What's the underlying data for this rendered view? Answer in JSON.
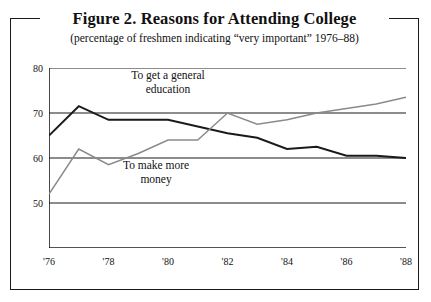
{
  "figure": {
    "title": "Figure 2.  Reasons for Attending College",
    "subtitle": "(percentage of freshmen indicating “very important” 1976–88)"
  },
  "chart_data": {
    "type": "line",
    "title": "Figure 2.  Reasons for Attending College",
    "subtitle": "(percentage of freshmen indicating “very important” 1976–88)",
    "xlabel": "",
    "ylabel": "",
    "xlim": [
      1976,
      1988
    ],
    "ylim": [
      40,
      80
    ],
    "grid": true,
    "grid_axis": "y",
    "legend_position": "inline-annotations",
    "x": [
      1976,
      1977,
      1978,
      1979,
      1980,
      1981,
      1982,
      1983,
      1984,
      1985,
      1986,
      1987,
      1988
    ],
    "x_tick_values": [
      1976,
      1977,
      1978,
      1979,
      1980,
      1981,
      1982,
      1983,
      1984,
      1985,
      1986,
      1987,
      1988
    ],
    "x_tick_labels": [
      "'76",
      "",
      "'78",
      "",
      "'80",
      "",
      "'82",
      "",
      "'84",
      "",
      "'86",
      "",
      "'88"
    ],
    "y_tick_values": [
      80,
      70,
      60,
      50
    ],
    "y_tick_labels": [
      "80",
      "70",
      "60",
      "50"
    ],
    "series": [
      {
        "name": "To get a general education",
        "color": "#1a1a1a",
        "width": 1.9,
        "values": [
          65.0,
          71.5,
          68.5,
          68.5,
          68.5,
          67.0,
          65.5,
          64.5,
          62.0,
          62.5,
          60.5,
          60.5,
          60.0
        ]
      },
      {
        "name": "To make more money",
        "color": "#8a8a8a",
        "width": 1.5,
        "values": [
          52.0,
          62.0,
          58.5,
          61.0,
          64.0,
          64.0,
          70.0,
          67.5,
          68.5,
          70.0,
          71.0,
          72.0,
          73.5
        ]
      }
    ],
    "annotations": [
      {
        "text_line1": "To get a general",
        "text_line2": "education",
        "x": 1980.0,
        "y": 78.0
      },
      {
        "text_line1": "To make more",
        "text_line2": "money",
        "x": 1979.6,
        "y": 58.0
      }
    ]
  },
  "axis": {
    "y_labels": [
      "80",
      "70",
      "60",
      "50"
    ],
    "x_labels": [
      "'76",
      "'78",
      "'80",
      "'82",
      "'84",
      "'86",
      "'88"
    ]
  },
  "colors": {
    "series_dark": "#1a1a1a",
    "series_gray": "#8a8a8a",
    "axis": "#1a1a1a",
    "background": "#ffffff"
  }
}
